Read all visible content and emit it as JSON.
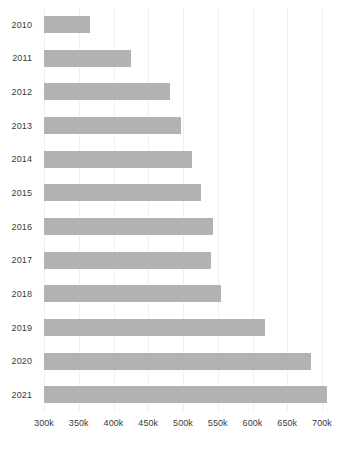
{
  "chart_data": {
    "type": "bar",
    "orientation": "horizontal",
    "title": "",
    "subtitle": "",
    "xlabel": "",
    "ylabel": "",
    "categories": [
      "2010",
      "2011",
      "2012",
      "2013",
      "2014",
      "2015",
      "2016",
      "2017",
      "2018",
      "2019",
      "2020",
      "2021"
    ],
    "values": [
      366000,
      425000,
      481000,
      497000,
      513000,
      526000,
      543000,
      540000,
      555000,
      618000,
      684000,
      707000
    ],
    "value_labels": [
      "366k",
      "425k",
      "481k",
      "497k",
      "513k",
      "526k",
      "543k",
      "540k",
      "555k",
      "618k",
      "684k",
      "707k"
    ],
    "xlim": [
      300000,
      700000
    ],
    "xticks": [
      300000,
      350000,
      400000,
      450000,
      500000,
      550000,
      600000,
      650000,
      700000
    ],
    "xtick_labels": [
      "300k",
      "350k",
      "400k",
      "450k",
      "500k",
      "550k",
      "600k",
      "650k",
      "700k"
    ],
    "grid": true,
    "grid_axis": "x",
    "legend": false,
    "legend_position": "none",
    "bar_color": "#b2b2b2",
    "grid_color": "#f0f0f0",
    "text_color": "#3a3a3a",
    "background_color": "#ffffff"
  }
}
